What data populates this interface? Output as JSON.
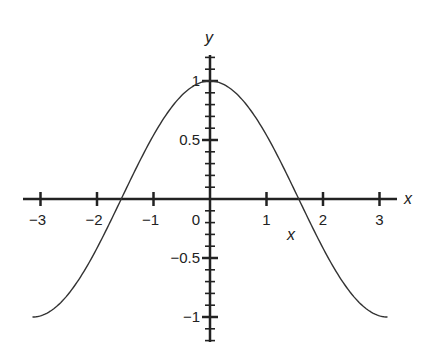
{
  "chart_data": {
    "type": "line",
    "title": "",
    "function": "y = cos(x)",
    "xlabel": "x",
    "ylabel": "y",
    "extra_label": "x",
    "xlim": [
      -3.14159,
      3.14159
    ],
    "ylim": [
      -1,
      1
    ],
    "grid": false,
    "legend": null,
    "x_ticks": [
      -3,
      -2,
      -1,
      0,
      1,
      2,
      3
    ],
    "x_tick_labels": [
      "−3",
      "−2",
      "−1",
      "0",
      "1",
      "2",
      "3"
    ],
    "y_ticks": [
      1,
      0.5,
      -0.5,
      -1
    ],
    "y_tick_labels": [
      "1",
      "0.5",
      "−0.5",
      "−1"
    ],
    "series": [
      {
        "name": "cos(x)",
        "x": [
          -3.14,
          -2.5,
          -2,
          -1.5708,
          -1,
          -0.5,
          0,
          0.5,
          1,
          1.5708,
          2,
          2.5,
          3.14
        ],
        "values": [
          -1,
          -0.801,
          -0.416,
          0,
          0.54,
          0.878,
          1,
          0.878,
          0.54,
          0,
          -0.416,
          -0.801,
          -1
        ],
        "color": "#333333"
      }
    ]
  }
}
